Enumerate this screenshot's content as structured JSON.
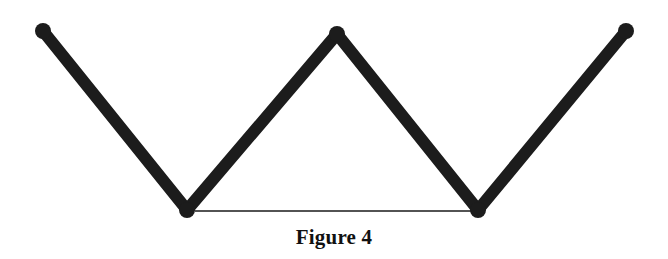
{
  "figure": {
    "caption": "Figure 4",
    "stroke_color": "#1c1c1c",
    "thin_line_color": "#1a1a1a",
    "rods": [
      {
        "id": "rod-1",
        "from": [
          43,
          31
        ],
        "to": [
          187,
          210
        ]
      },
      {
        "id": "rod-2",
        "from": [
          187,
          210
        ],
        "to": [
          337,
          34
        ]
      },
      {
        "id": "rod-3",
        "from": [
          337,
          34
        ],
        "to": [
          478,
          210
        ]
      },
      {
        "id": "rod-4",
        "from": [
          478,
          210
        ],
        "to": [
          626,
          31
        ]
      }
    ],
    "string": {
      "from": [
        195,
        211
      ],
      "to": [
        472,
        211
      ]
    },
    "joints": [
      {
        "id": "end-left",
        "point": [
          43,
          31
        ]
      },
      {
        "id": "bottom-left",
        "point": [
          187,
          210
        ]
      },
      {
        "id": "top-middle",
        "point": [
          337,
          34
        ]
      },
      {
        "id": "bottom-right",
        "point": [
          478,
          210
        ]
      },
      {
        "id": "end-right",
        "point": [
          626,
          31
        ]
      }
    ]
  }
}
